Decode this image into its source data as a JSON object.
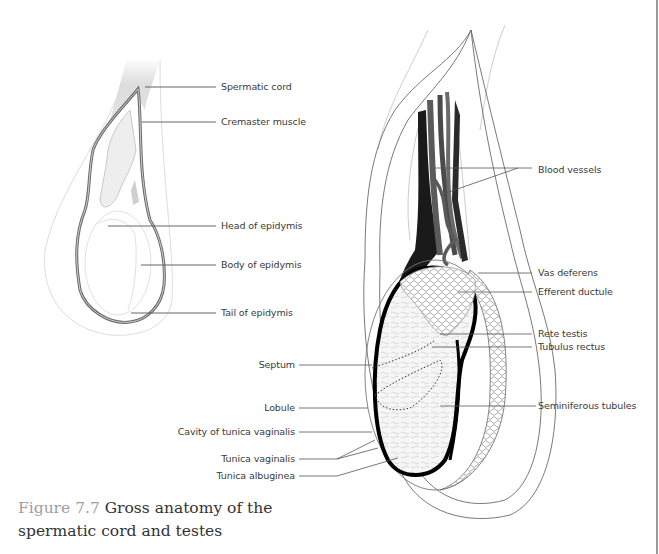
{
  "figure": {
    "number_label": "Figure 7.7",
    "title": "Gross anatomy of the spermatic cord and testes"
  },
  "left_diagram": {
    "labels": [
      {
        "id": "spermatic-cord",
        "text": "Spermatic cord"
      },
      {
        "id": "cremaster-muscle",
        "text": "Cremaster muscle"
      },
      {
        "id": "head-of-epidymis",
        "text": "Head of epidymis"
      },
      {
        "id": "body-of-epidymis",
        "text": "Body of epidymis"
      },
      {
        "id": "tail-of-epidymis",
        "text": "Tail of epidymis"
      }
    ]
  },
  "right_diagram": {
    "right_labels": [
      {
        "id": "blood-vessels",
        "text": "Blood vessels"
      },
      {
        "id": "vas-deferens",
        "text": "Vas deferens"
      },
      {
        "id": "efferent-ductule",
        "text": "Efferent ductule"
      },
      {
        "id": "rete-testis",
        "text": "Rete testis"
      },
      {
        "id": "tubulus-rectus",
        "text": "Tubulus rectus"
      },
      {
        "id": "seminiferous-tubules",
        "text": "Seminiferous tubules"
      }
    ],
    "left_labels": [
      {
        "id": "septum",
        "text": "Septum"
      },
      {
        "id": "lobule",
        "text": "Lobule"
      },
      {
        "id": "cavity-of-tunica-vaginalis",
        "text": "Cavity of tunica vaginalis"
      },
      {
        "id": "tunica-vaginalis",
        "text": "Tunica vaginalis"
      },
      {
        "id": "tunica-albuginea",
        "text": "Tunica albuginea"
      }
    ]
  },
  "colors": {
    "outline": "#555555",
    "leader_line": "#555555",
    "caption_number": "#9e9e9e",
    "caption_text": "#333333",
    "vessel_dark": "#1a1a1a",
    "vessel_mid": "#5a5a5a",
    "cord_shade": "#d6d6d6"
  }
}
